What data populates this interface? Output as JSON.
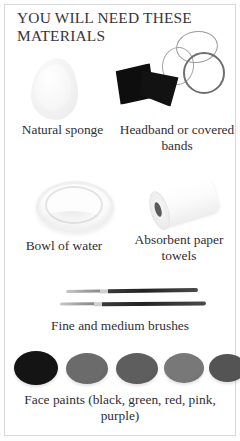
{
  "page": {
    "title": "YOU WILL NEED THESE MATERIALS",
    "border_color": "#d8d8d8",
    "background_color": "#ffffff",
    "text_color": "#2f2e33"
  },
  "items": [
    {
      "id": "natural-sponge",
      "caption": "Natural sponge",
      "image_name": "sponge-illustration",
      "color": "#f2f2f2"
    },
    {
      "id": "headband-covered-bands",
      "caption": "Headband or covered bands",
      "image_name": "headband-and-bands-illustration",
      "color": "#0e0e0e"
    },
    {
      "id": "bowl-of-water",
      "caption": "Bowl of water",
      "image_name": "bowl-illustration",
      "color": "#efefef"
    },
    {
      "id": "absorbent-paper-towels",
      "caption": "Absorbent paper towels",
      "image_name": "paper-towel-roll-illustration",
      "color": "#ffffff"
    },
    {
      "id": "brushes",
      "caption": "Fine and medium brushes",
      "image_name": "paint-brushes-illustration",
      "color": "#222224"
    },
    {
      "id": "face-paints",
      "caption": "Face paints (black, green, red, pink, purple)",
      "image_name": "face-paint-dots-illustration",
      "color": "#141414"
    }
  ],
  "paints": [
    {
      "name": "black",
      "swatch": "#141414",
      "width": 44,
      "height": 34,
      "left": 0
    },
    {
      "name": "green",
      "swatch": "#6b6b6b",
      "width": 42,
      "height": 31,
      "left": 52
    },
    {
      "name": "red",
      "swatch": "#5e5e5e",
      "width": 42,
      "height": 31,
      "left": 102
    },
    {
      "name": "pink",
      "swatch": "#787878",
      "width": 40,
      "height": 30,
      "left": 150
    },
    {
      "name": "purple",
      "swatch": "#545454",
      "width": 37,
      "height": 28,
      "left": 195
    }
  ]
}
